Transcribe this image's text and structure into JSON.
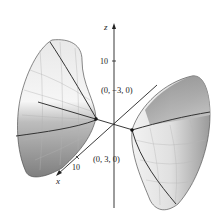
{
  "figure": {
    "type": "hyperboloid-of-two-sheets",
    "axes": {
      "x": {
        "label": "x",
        "tick": "10"
      },
      "y": {
        "label": "y",
        "tick": "10"
      },
      "z": {
        "label": "z",
        "tick": "10"
      }
    },
    "points": [
      {
        "label": "(0, −3, 0)"
      },
      {
        "label": "(0, 3, 0)"
      }
    ],
    "colors": {
      "surface_light": "#f2f2f2",
      "surface_mid": "#c8c8c8",
      "surface_dark": "#8a8a8a",
      "axis": "#222222",
      "curve": "#3a3a3a"
    }
  }
}
